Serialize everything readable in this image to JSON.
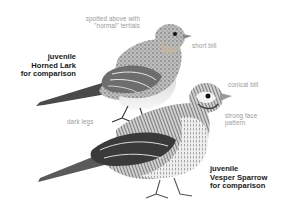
{
  "illustration": {
    "subject": "juvenile Horned Lark and juvenile Vesper Sparrow comparison",
    "palette": {
      "ink": "#1a1a1a",
      "label_gray": "#9a9a9a",
      "background": "#ffffff"
    }
  },
  "birds": {
    "horned_lark": {
      "title_lines": [
        "juvenile",
        "Horned Lark",
        "for comparison"
      ],
      "annotations": {
        "back": [
          "spotted above with",
          "\"normal\" tertials"
        ],
        "bill": "short bill",
        "legs": "dark legs"
      }
    },
    "vesper_sparrow": {
      "title_lines": [
        "juvenile",
        "Vesper Sparrow",
        "for comparison"
      ],
      "annotations": {
        "bill": "conical bill",
        "face": [
          "strong face",
          "pattern"
        ]
      }
    }
  }
}
